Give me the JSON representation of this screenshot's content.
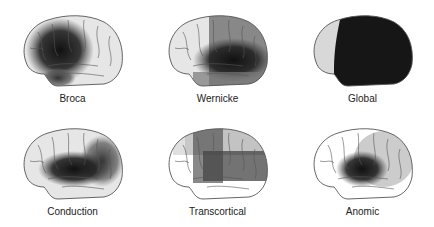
{
  "figure": {
    "panels": [
      {
        "label": "Broca",
        "lesion": "frontal"
      },
      {
        "label": "Wernicke",
        "lesion": "temporoparietal"
      },
      {
        "label": "Global",
        "lesion": "global"
      },
      {
        "label": "Conduction",
        "lesion": "perisylvian"
      },
      {
        "label": "Transcortical",
        "lesion": "watershed"
      },
      {
        "label": "Anomic",
        "lesion": "diffuse"
      }
    ],
    "colors": {
      "brain_fill": "#e6e6e6",
      "outline": "#555555",
      "lesion_dark": "#1a1a1a",
      "lesion_mid": "#6a6a6a"
    }
  }
}
